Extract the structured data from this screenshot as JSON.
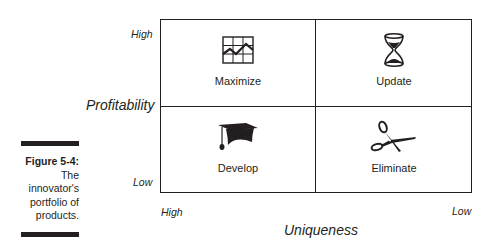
{
  "caption": {
    "figure": "Figure 5-4:",
    "text_lines": [
      "The",
      "innovator's",
      "portfolio of",
      "products."
    ]
  },
  "y_axis": {
    "title": "Profitability",
    "high": "High",
    "low": "Low"
  },
  "x_axis": {
    "title": "Uniqueness",
    "high": "High",
    "low": "Low"
  },
  "quadrants": [
    {
      "position": "top-left",
      "label": "Maximize",
      "icon": "line-chart-icon"
    },
    {
      "position": "top-right",
      "label": "Update",
      "icon": "hourglass-icon"
    },
    {
      "position": "bottom-left",
      "label": "Develop",
      "icon": "graduation-cap-icon"
    },
    {
      "position": "bottom-right",
      "label": "Eliminate",
      "icon": "scissors-icon"
    }
  ],
  "colors": {
    "ink": "#231f20",
    "background": "#ffffff"
  }
}
